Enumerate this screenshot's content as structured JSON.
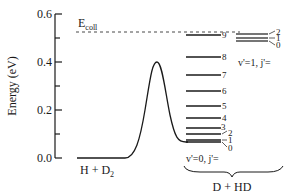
{
  "diagram": {
    "type": "energy-level diagram",
    "y_axis": {
      "label": "Energy (eV)",
      "ticks": [
        "0.0",
        "0.2",
        "0.4",
        "0.6"
      ],
      "tick_values": [
        0.0,
        0.2,
        0.4,
        0.6
      ],
      "minor_ticks": [
        0.1,
        0.3,
        0.5
      ]
    },
    "collision_energy": {
      "label": "E",
      "subscript": "coll",
      "value": 0.52
    },
    "reactants": {
      "label_main": "H + D",
      "label_sub": "2",
      "energy": 0.0
    },
    "barrier": {
      "height": 0.4
    },
    "products": {
      "label": "D + HD",
      "v0": {
        "label": "v'=0, j'=",
        "levels": [
          {
            "j": "0",
            "energy": 0.065
          },
          {
            "j": "1",
            "energy": 0.07
          },
          {
            "j": "2",
            "energy": 0.095
          },
          {
            "j": "3",
            "energy": 0.12
          },
          {
            "j": "4",
            "energy": 0.165
          },
          {
            "j": "5",
            "energy": 0.215
          },
          {
            "j": "6",
            "energy": 0.28
          },
          {
            "j": "7",
            "energy": 0.345
          },
          {
            "j": "8",
            "energy": 0.42
          },
          {
            "j": "9",
            "energy": 0.51
          }
        ]
      },
      "v1": {
        "label": "v'=1, j'=",
        "levels": [
          {
            "j": "0",
            "energy": 0.485
          },
          {
            "j": "1",
            "energy": 0.495
          },
          {
            "j": "2",
            "energy": 0.515
          }
        ]
      }
    }
  }
}
